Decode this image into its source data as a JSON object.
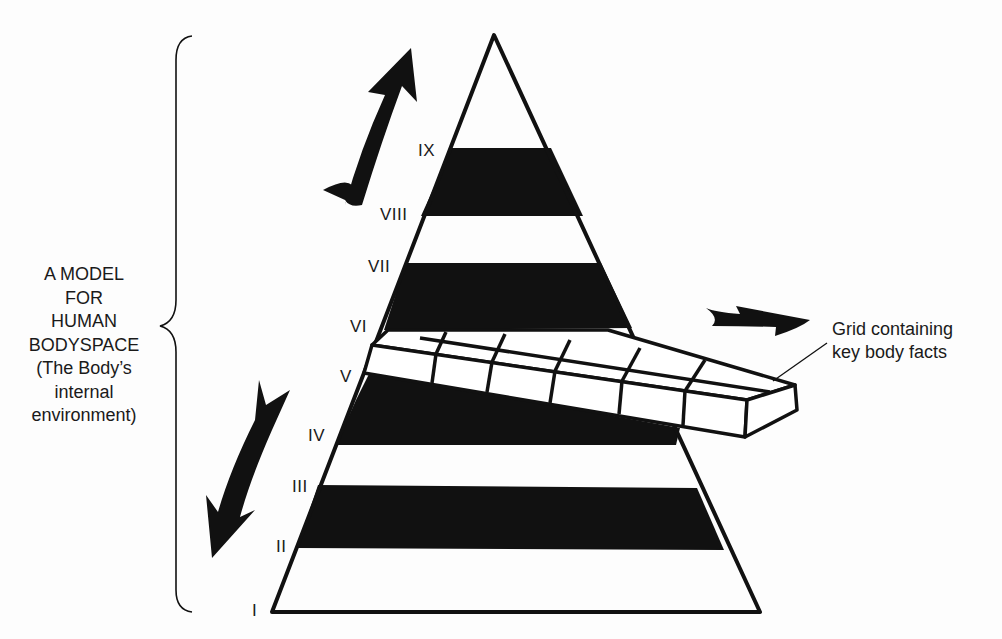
{
  "caption": {
    "lines": [
      "A MODEL",
      "FOR",
      "HUMAN",
      "BODYSPACE",
      "(The Body’s",
      "internal",
      "environment)"
    ]
  },
  "grid_label": {
    "line1": "Grid containing",
    "line2": "key body facts"
  },
  "levels": [
    {
      "numeral": "I",
      "x": 252,
      "y": 602
    },
    {
      "numeral": "II",
      "x": 276,
      "y": 538
    },
    {
      "numeral": "III",
      "x": 292,
      "y": 478
    },
    {
      "numeral": "IV",
      "x": 308,
      "y": 427
    },
    {
      "numeral": "V",
      "x": 340,
      "y": 368
    },
    {
      "numeral": "VI",
      "x": 350,
      "y": 318
    },
    {
      "numeral": "VII",
      "x": 368,
      "y": 258
    },
    {
      "numeral": "VIII",
      "x": 380,
      "y": 206
    },
    {
      "numeral": "IX",
      "x": 418,
      "y": 142
    }
  ],
  "icons": {
    "up_arrow": "curved-arrow-up-icon",
    "down_arrow": "curved-arrow-down-icon",
    "right_arrow": "arrow-right-icon"
  },
  "colors": {
    "ink": "#111111",
    "paper": "#fdfdfd"
  }
}
